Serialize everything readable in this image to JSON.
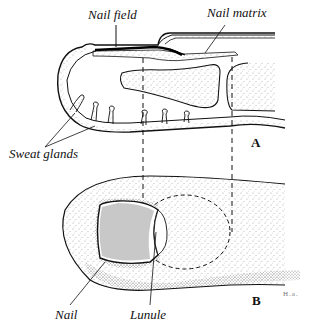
{
  "figure": {
    "panels": [
      {
        "id": "A",
        "label": "A",
        "description": "Longitudinal section of fingertip"
      },
      {
        "id": "B",
        "label": "B",
        "description": "Dorsal view of fingertip"
      }
    ],
    "labels": {
      "nail_field": "Nail field",
      "nail_matrix": "Nail matrix",
      "sweat_glands": "Sweat glands",
      "nail": "Nail",
      "lunule": "Lunule"
    },
    "signature": "H.a."
  },
  "colors": {
    "ink": "#111111",
    "background": "#ffffff",
    "stipple": "#555555"
  }
}
